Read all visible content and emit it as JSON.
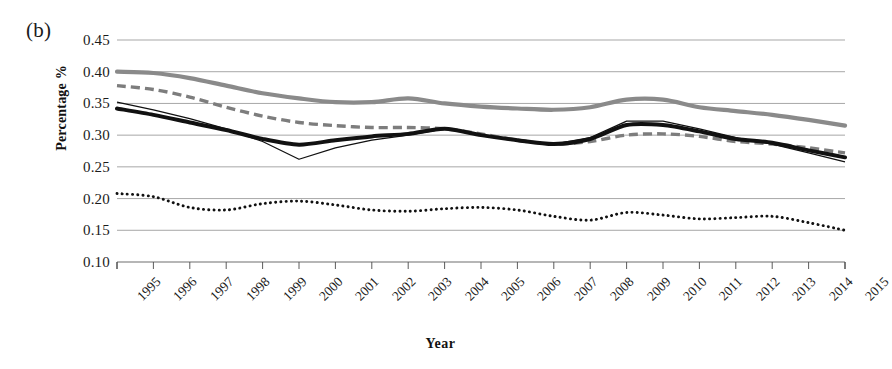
{
  "panel": {
    "label": "(b)"
  },
  "chart_data": {
    "type": "line",
    "title": "",
    "panel_label": "(b)",
    "xlabel": "Year",
    "ylabel": "Percentage %",
    "ylim": [
      0.1,
      0.45
    ],
    "yticks": [
      "0.10",
      "0.15",
      "0.20",
      "0.25",
      "0.30",
      "0.35",
      "0.40",
      "0.45"
    ],
    "ytick_values": [
      0.1,
      0.15,
      0.2,
      0.25,
      0.3,
      0.35,
      0.4,
      0.45
    ],
    "grid": "horizontal",
    "legend": "none",
    "categories": [
      "1995",
      "1996",
      "1997",
      "1998",
      "1999",
      "2000",
      "2001",
      "2002",
      "2003",
      "2004",
      "2005",
      "2006",
      "2007",
      "2008",
      "2009",
      "2010",
      "2011",
      "2012",
      "2013",
      "2014",
      "2015"
    ],
    "x": [
      1995,
      1996,
      1997,
      1998,
      1999,
      2000,
      2001,
      2002,
      2003,
      2004,
      2005,
      2006,
      2007,
      2008,
      2009,
      2010,
      2011,
      2012,
      2013,
      2014,
      2015
    ],
    "series": [
      {
        "name": "series-1",
        "style": "solid-thick-gray",
        "color": "#8a8a8a",
        "values": [
          0.4,
          0.398,
          0.39,
          0.378,
          0.366,
          0.358,
          0.352,
          0.352,
          0.358,
          0.35,
          0.345,
          0.342,
          0.34,
          0.344,
          0.356,
          0.356,
          0.344,
          0.338,
          0.332,
          0.324,
          0.315
        ]
      },
      {
        "name": "series-2",
        "style": "dashed-gray",
        "color": "#7d7d7d",
        "values": [
          0.378,
          0.372,
          0.36,
          0.344,
          0.33,
          0.32,
          0.315,
          0.312,
          0.312,
          0.31,
          0.302,
          0.292,
          0.286,
          0.29,
          0.3,
          0.302,
          0.298,
          0.29,
          0.286,
          0.28,
          0.272
        ]
      },
      {
        "name": "series-3",
        "style": "solid-thin-black",
        "color": "#111111",
        "values": [
          0.352,
          0.34,
          0.326,
          0.31,
          0.29,
          0.262,
          0.28,
          0.292,
          0.3,
          0.31,
          0.3,
          0.292,
          0.286,
          0.296,
          0.322,
          0.322,
          0.31,
          0.296,
          0.286,
          0.272,
          0.258
        ]
      },
      {
        "name": "series-4",
        "style": "solid-thick-black",
        "color": "#111111",
        "values": [
          0.342,
          0.332,
          0.32,
          0.308,
          0.294,
          0.285,
          0.292,
          0.298,
          0.302,
          0.31,
          0.3,
          0.292,
          0.286,
          0.294,
          0.316,
          0.316,
          0.306,
          0.294,
          0.288,
          0.276,
          0.265
        ]
      },
      {
        "name": "series-5",
        "style": "dotted-black",
        "color": "#111111",
        "values": [
          0.208,
          0.203,
          0.186,
          0.182,
          0.192,
          0.196,
          0.19,
          0.182,
          0.18,
          0.184,
          0.186,
          0.182,
          0.172,
          0.166,
          0.178,
          0.174,
          0.168,
          0.17,
          0.172,
          0.162,
          0.15
        ]
      }
    ]
  }
}
